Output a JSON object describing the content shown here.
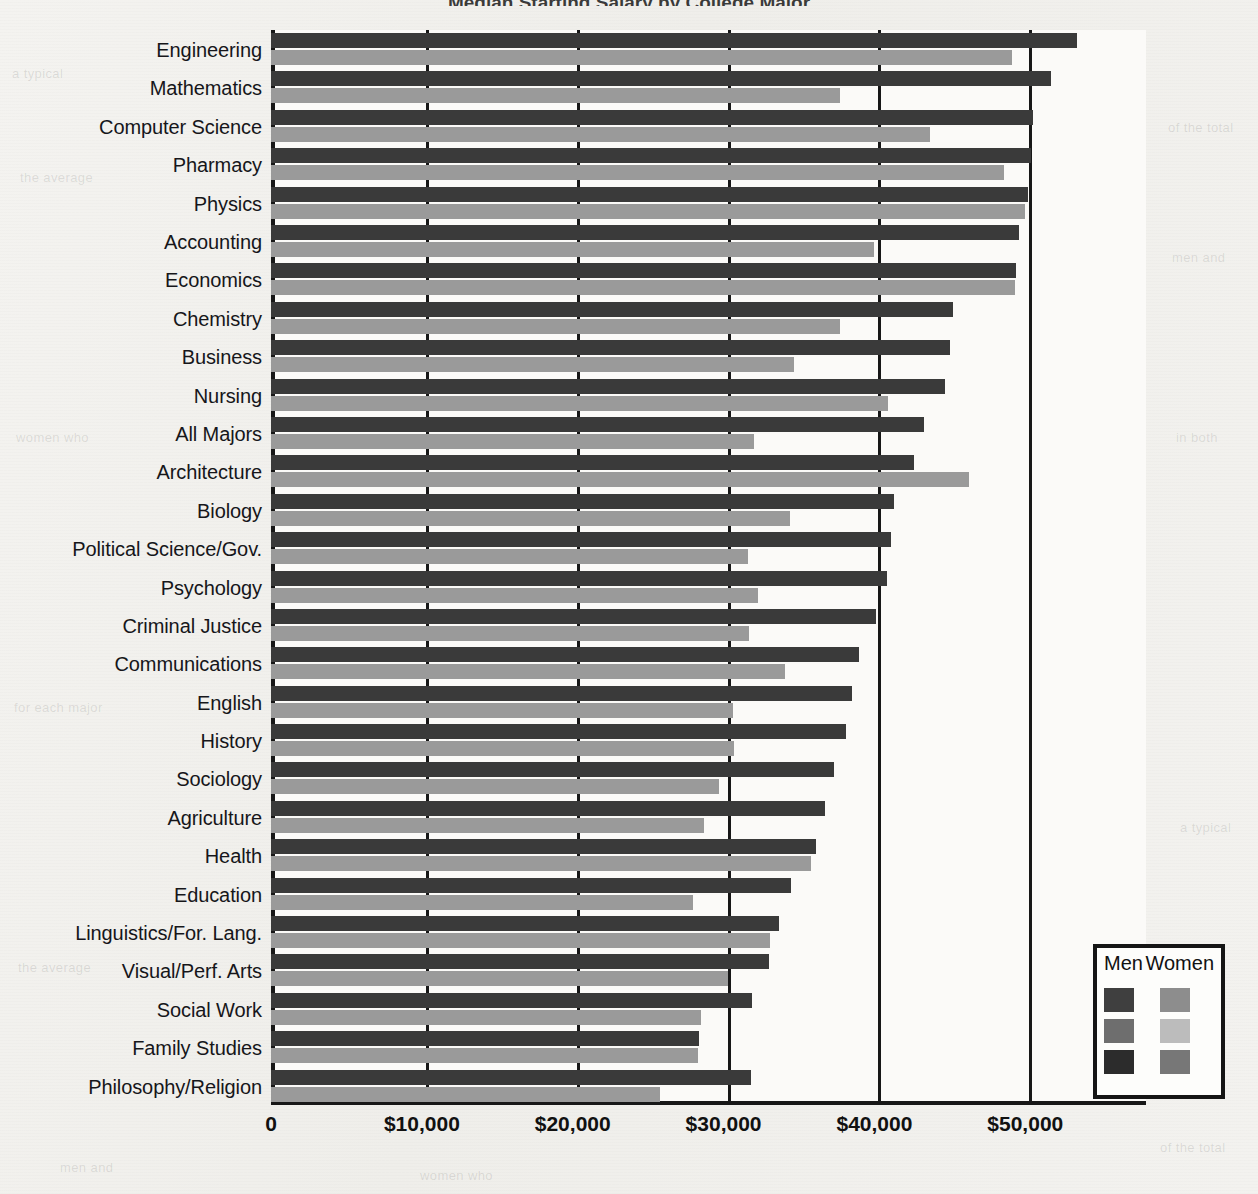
{
  "chart_data": {
    "type": "bar",
    "orientation": "horizontal",
    "title": "Median Starting Salary by College Major",
    "xlabel": "",
    "ylabel": "",
    "xlim": [
      0,
      58000
    ],
    "xticks": [
      0,
      10000,
      20000,
      30000,
      40000,
      50000
    ],
    "xtick_labels": [
      "0",
      "$10,000",
      "$20,000",
      "$30,000",
      "$40,000",
      "$50,000"
    ],
    "grid": true,
    "legend_position": "bottom-right",
    "legend_title_men": "Men",
    "legend_title_women": "Women",
    "categories": [
      "Engineering",
      "Mathematics",
      "Computer Science",
      "Pharmacy",
      "Physics",
      "Accounting",
      "Economics",
      "Chemistry",
      "Business",
      "Nursing",
      "All Majors",
      "Architecture",
      "Biology",
      "Political Science/Gov.",
      "Psychology",
      "Criminal Justice",
      "Communications",
      "English",
      "History",
      "Sociology",
      "Agriculture",
      "Health",
      "Education",
      "Linguistics/For. Lang.",
      "Visual/Perf. Arts",
      "Social Work",
      "Family Studies",
      "Philosophy/Religion"
    ],
    "series": [
      {
        "name": "Men",
        "color": "#3a3a3a",
        "values": [
          53400,
          51700,
          50500,
          50400,
          50200,
          49600,
          49400,
          45200,
          45000,
          44700,
          43300,
          42600,
          41300,
          41100,
          40800,
          40100,
          39000,
          38500,
          38100,
          37300,
          36700,
          36100,
          34500,
          33700,
          33000,
          31900,
          28400,
          31800
        ]
      },
      {
        "name": "Women",
        "color": "#9a9a9a",
        "values": [
          49100,
          37700,
          43700,
          48600,
          50000,
          40000,
          49300,
          37700,
          34700,
          40900,
          32000,
          46300,
          34400,
          31600,
          32300,
          31700,
          34100,
          30600,
          30700,
          29700,
          28700,
          35800,
          28000,
          33100,
          30300,
          28500,
          28300,
          25800
        ]
      }
    ]
  },
  "legend": {
    "men_label": "Men",
    "women_label": "Women",
    "swatches": [
      {
        "men": "#3f3f3f",
        "women": "#8d8d8d"
      },
      {
        "men": "#6e6e6e",
        "women": "#bcbcbc"
      },
      {
        "men": "#2c2c2c",
        "women": "#777777"
      }
    ]
  },
  "page_bleed": [
    "a typical",
    "the average",
    "of the total",
    "men and",
    "women who",
    "in both",
    "for each major"
  ]
}
